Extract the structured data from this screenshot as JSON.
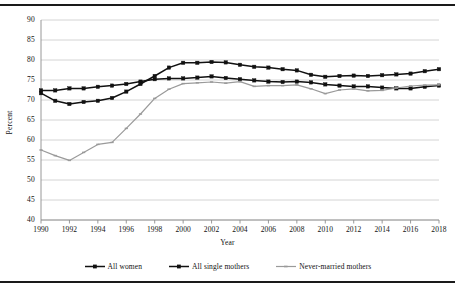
{
  "chart_data": {
    "type": "line",
    "title": "",
    "xlabel": "Year",
    "ylabel": "Percent",
    "ylim": [
      40,
      90
    ],
    "ytick_step": 5,
    "yticks": [
      40,
      45,
      50,
      55,
      60,
      65,
      70,
      75,
      80,
      85,
      90
    ],
    "xlim": [
      1990,
      2018
    ],
    "xtick_step": 2,
    "xticks": [
      1990,
      1992,
      1994,
      1996,
      1998,
      2000,
      2002,
      2004,
      2006,
      2008,
      2010,
      2012,
      2014,
      2016,
      2018
    ],
    "x": [
      1990,
      1991,
      1992,
      1993,
      1994,
      1995,
      1996,
      1997,
      1998,
      1999,
      2000,
      2001,
      2002,
      2003,
      2004,
      2005,
      2006,
      2007,
      2008,
      2009,
      2010,
      2011,
      2012,
      2013,
      2014,
      2015,
      2016,
      2017,
      2018
    ],
    "grid": true,
    "grid_axis": "y",
    "legend_position": "bottom",
    "series": [
      {
        "name": "All women",
        "color": "#111111",
        "marker": "square",
        "values": [
          72.4,
          72.4,
          72.9,
          72.9,
          73.3,
          73.6,
          74.0,
          74.6,
          75.2,
          75.4,
          75.4,
          75.6,
          75.9,
          75.5,
          75.2,
          74.9,
          74.6,
          74.5,
          74.6,
          74.4,
          73.9,
          73.6,
          73.4,
          73.4,
          73.1,
          72.9,
          72.9,
          73.3,
          73.6
        ]
      },
      {
        "name": "All single mothers",
        "color": "#111111",
        "marker": "square",
        "values": [
          71.7,
          69.8,
          69.0,
          69.5,
          69.8,
          70.5,
          72.1,
          74.0,
          76.0,
          78.1,
          79.3,
          79.3,
          79.5,
          79.4,
          78.8,
          78.3,
          78.1,
          77.7,
          77.4,
          76.3,
          75.8,
          76.0,
          76.1,
          76.0,
          76.2,
          76.4,
          76.6,
          77.2,
          77.7
        ]
      },
      {
        "name": "Never-married mothers",
        "color": "#9a9a9a",
        "marker": "dash",
        "values": [
          57.5,
          56.1,
          54.9,
          56.9,
          58.9,
          59.4,
          62.9,
          66.5,
          70.4,
          72.7,
          74.1,
          74.3,
          74.5,
          74.2,
          74.6,
          73.4,
          73.6,
          73.6,
          73.8,
          72.8,
          71.6,
          72.5,
          72.8,
          72.3,
          72.4,
          73.0,
          73.5,
          73.7,
          73.8
        ]
      }
    ]
  },
  "axis": {
    "y_title": "Percent",
    "x_title": "Year"
  }
}
